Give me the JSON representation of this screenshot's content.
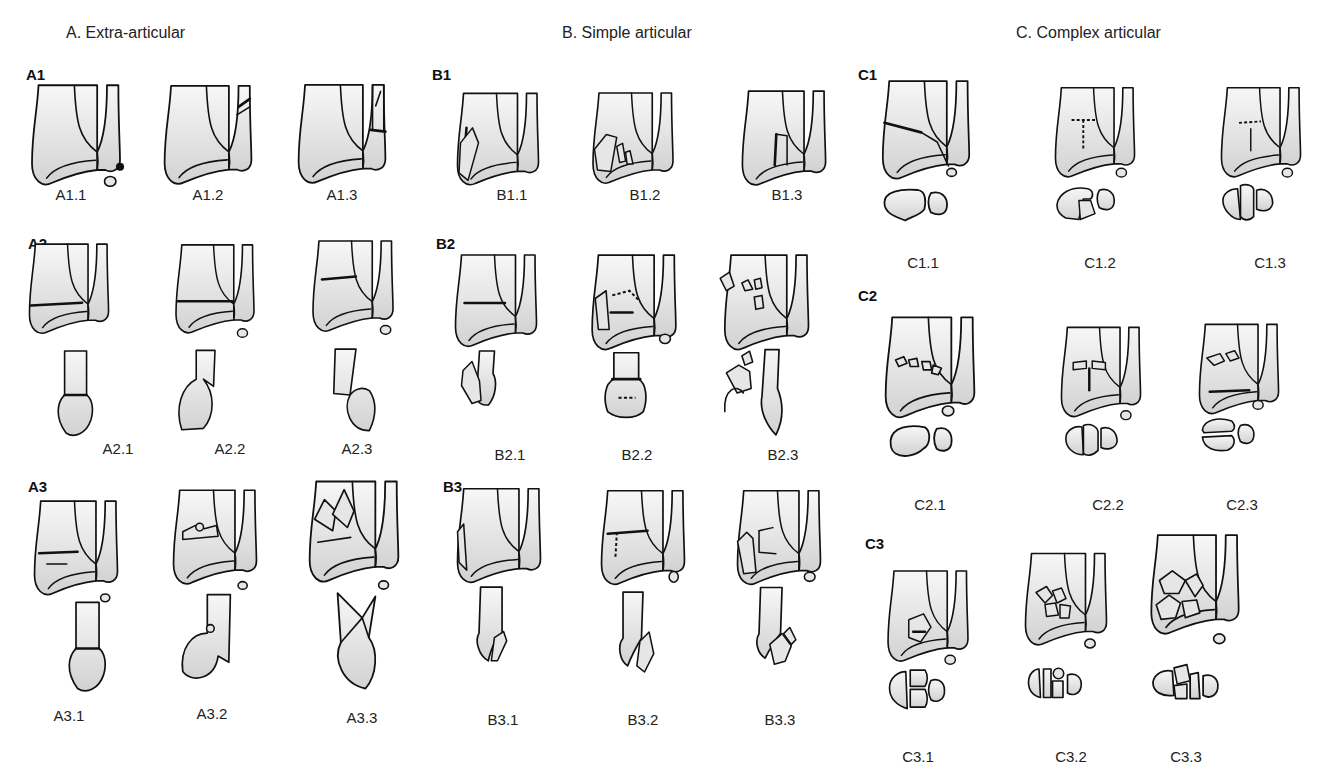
{
  "sections": [
    {
      "id": "A",
      "title": "A. Extra-articular",
      "groups": [
        {
          "id": "A1",
          "label": "A1",
          "figures": [
            "A1.1",
            "A1.2",
            "A1.3"
          ]
        },
        {
          "id": "A2",
          "label": "A2",
          "figures": [
            "A2.1",
            "A2.2",
            "A2.3"
          ]
        },
        {
          "id": "A3",
          "label": "A3",
          "figures": [
            "A3.1",
            "A3.2",
            "A3.3"
          ]
        }
      ]
    },
    {
      "id": "B",
      "title": "B. Simple articular",
      "groups": [
        {
          "id": "B1",
          "label": "B1",
          "figures": [
            "B1.1",
            "B1.2",
            "B1.3"
          ]
        },
        {
          "id": "B2",
          "label": "B2",
          "figures": [
            "B2.1",
            "B2.2",
            "B2.3"
          ]
        },
        {
          "id": "B3",
          "label": "B3",
          "figures": [
            "B3.1",
            "B3.2",
            "B3.3"
          ]
        }
      ]
    },
    {
      "id": "C",
      "title": "C. Complex articular",
      "groups": [
        {
          "id": "C1",
          "label": "C1",
          "figures": [
            "C1.1",
            "C1.2",
            "C1.3"
          ]
        },
        {
          "id": "C2",
          "label": "C2",
          "figures": [
            "C2.1",
            "C2.2",
            "C2.3"
          ]
        },
        {
          "id": "C3",
          "label": "C3",
          "figures": [
            "C3.1",
            "C3.2",
            "C3.3"
          ]
        }
      ]
    }
  ],
  "colors": {
    "ink": "#111111",
    "bone_fill_light": "#f4f4f4",
    "bone_fill_dark": "#d4d4d4",
    "background": "#ffffff"
  }
}
